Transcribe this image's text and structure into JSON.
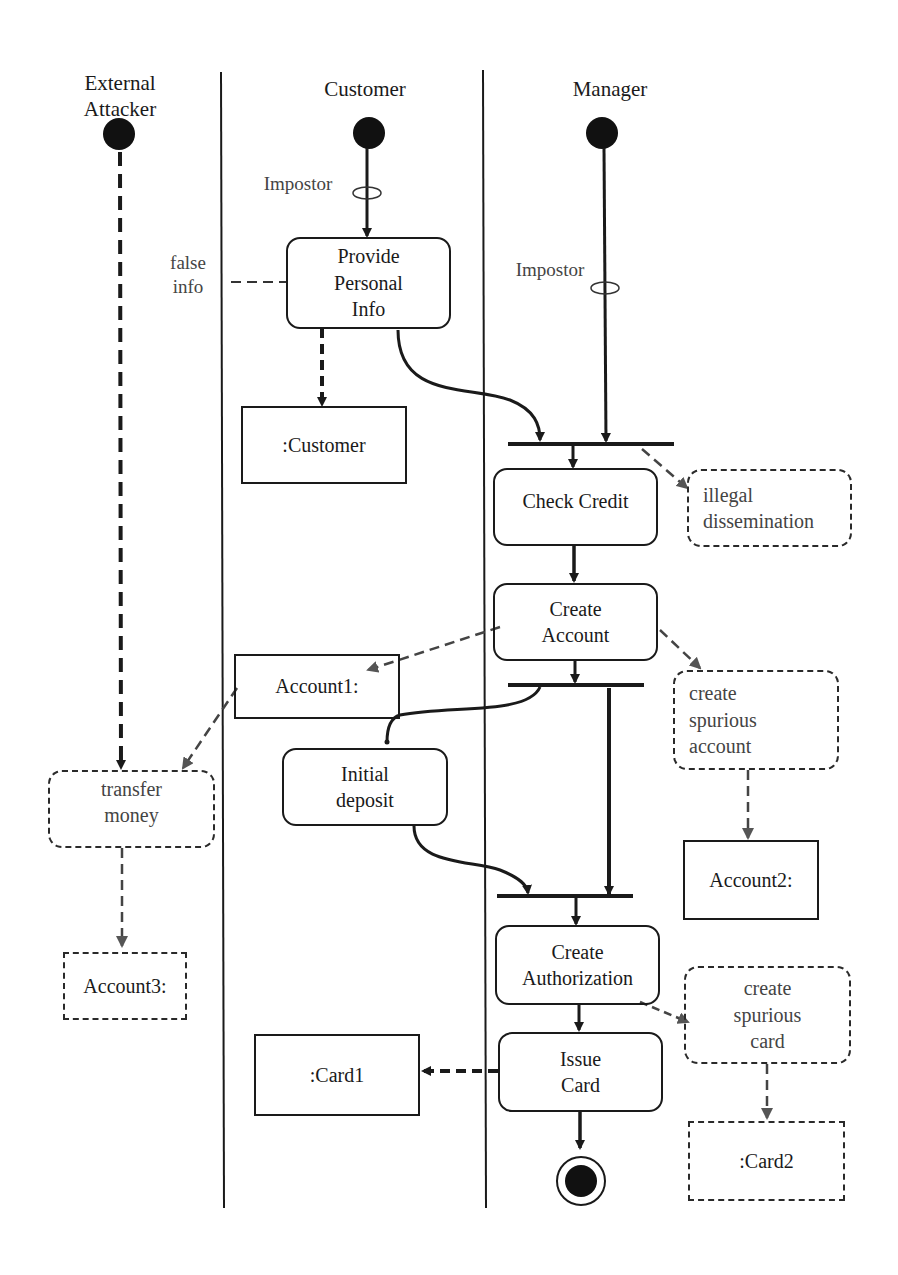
{
  "swimlanes": [
    {
      "id": "external-attacker",
      "title_lines": [
        "External",
        "Attacker"
      ]
    },
    {
      "id": "customer",
      "title_lines": [
        "Customer"
      ]
    },
    {
      "id": "manager",
      "title_lines": [
        "Manager"
      ]
    }
  ],
  "annotations": {
    "impostor_customer": "Impostor",
    "impostor_manager": "Impostor",
    "false_info_line1": "false",
    "false_info_line2": "info"
  },
  "activities": {
    "provide_personal_info": [
      "Provide",
      "Personal",
      "Info"
    ],
    "check_credit": [
      "Check Credit"
    ],
    "create_account": [
      "Create",
      "Account"
    ],
    "initial_deposit": [
      "Initial",
      "deposit"
    ],
    "create_authorization": [
      "Create",
      "Authorization"
    ],
    "issue_card": [
      "Issue",
      "Card"
    ]
  },
  "objects": {
    "customer": ":Customer",
    "account1": "Account1:",
    "account2": "Account2:",
    "card1": ":Card1"
  },
  "misuse_activities": {
    "illegal_dissemination": [
      "illegal",
      "dissemination"
    ],
    "create_spurious_account": [
      "create",
      "spurious",
      "account"
    ],
    "transfer_money": [
      "transfer",
      "money"
    ],
    "create_spurious_card": [
      "create",
      "spurious",
      "card"
    ]
  },
  "misuse_objects": {
    "account3": "Account3:",
    "card2": ":Card2"
  },
  "colors": {
    "ink": "#1a1a1a",
    "misuse_ink": "#444444",
    "background": "#ffffff"
  }
}
